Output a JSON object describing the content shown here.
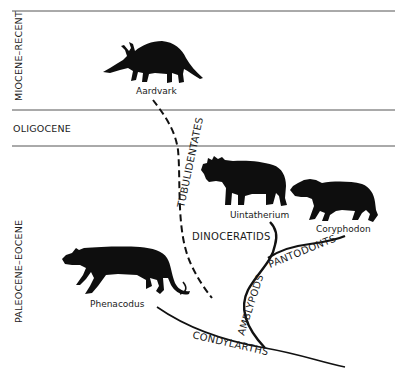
{
  "diagram": {
    "type": "phylogenetic-tree",
    "eras": [
      {
        "label": "MIOCENE–RECENT"
      },
      {
        "label": "OLIGOCENE"
      },
      {
        "label": "PALEOCENE–EOCENE"
      }
    ],
    "animals": [
      {
        "name": "Aardvark"
      },
      {
        "name": "Uintatherium"
      },
      {
        "name": "Coryphodon"
      },
      {
        "name": "Phenacodus"
      }
    ],
    "clades": [
      {
        "label": "TUBULIDENTATES"
      },
      {
        "label": "DINOCERATIDS"
      },
      {
        "label": "PANTODONTS"
      },
      {
        "label": "AMBLYPODS"
      },
      {
        "label": "CONDYLARTHS"
      }
    ],
    "colors": {
      "lines": "#111111",
      "silhouettes": "#0e0e0e",
      "era_dividers": "#555555",
      "background": "#ffffff"
    }
  }
}
